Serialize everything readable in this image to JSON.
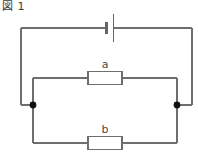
{
  "figure": {
    "caption": "図 1",
    "type": "electrical-circuit-schematic"
  },
  "colors": {
    "wire": "#6e6e6e",
    "wire_dark": "#555555",
    "node": "#111111",
    "text": "#4a4a4a",
    "background": "#ffffff",
    "component_fill": "#ffffff"
  },
  "components": {
    "battery": {
      "name": "battery",
      "label": "",
      "x": 110,
      "y": 28
    },
    "resistor_a": {
      "name": "resistor-a",
      "label": "a",
      "label_x": 104,
      "label_y": 68,
      "x": 88,
      "y": 72,
      "width": 34,
      "height": 13
    },
    "resistor_b": {
      "name": "resistor-b",
      "label": "b",
      "label_x": 104,
      "label_y": 125,
      "x": 88,
      "y": 130,
      "width": 34,
      "height": 13
    }
  },
  "nodes": [
    {
      "name": "junction-left",
      "x": 21,
      "y": 105
    },
    {
      "name": "junction-right",
      "x": 192,
      "y": 105
    }
  ],
  "geometry": {
    "outer_loop": {
      "left_x": 21,
      "right_x": 192,
      "top_y": 28,
      "bottom_y": 105
    },
    "branch_a": {
      "left_x": 33,
      "right_x": 177,
      "y": 78
    },
    "branch_b": {
      "left_x": 33,
      "right_x": 177,
      "y": 143
    }
  }
}
